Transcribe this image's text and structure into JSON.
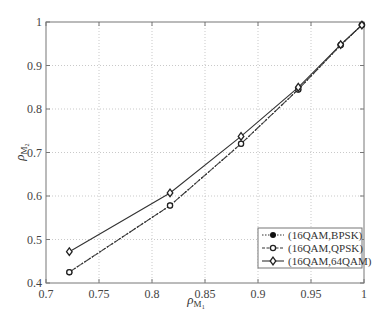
{
  "chart_data": {
    "type": "line",
    "title": "",
    "xlabel": "ρ_M1",
    "ylabel": "ρ_M2",
    "xlabel_main": "ρ",
    "xlabel_sub": "M",
    "xlabel_subsub": "1",
    "ylabel_main": "ρ",
    "ylabel_sub": "M",
    "ylabel_subsub": "2",
    "xlim": [
      0.7,
      1.0
    ],
    "ylim": [
      0.4,
      1.0
    ],
    "xticks": [
      "0.7",
      "0.75",
      "0.8",
      "0.85",
      "0.9",
      "0.95",
      "1"
    ],
    "yticks": [
      "0.4",
      "0.5",
      "0.6",
      "0.7",
      "0.8",
      "0.9",
      "1"
    ],
    "grid": true,
    "legend_position": "lower right",
    "x": [
      0.722,
      0.817,
      0.884,
      0.938,
      0.978,
      0.998
    ],
    "series": [
      {
        "name": "(16QAM,BPSK)",
        "style": "dotted",
        "marker": "filled-circle",
        "values": [
          0.425,
          0.578,
          0.72,
          0.845,
          0.947,
          0.993
        ]
      },
      {
        "name": "(16QAM,QPSK)",
        "style": "dashed",
        "marker": "open-circle",
        "values": [
          0.425,
          0.578,
          0.72,
          0.845,
          0.947,
          0.993
        ]
      },
      {
        "name": "(16QAM,64QAM)",
        "style": "solid",
        "marker": "diamond",
        "values": [
          0.472,
          0.607,
          0.737,
          0.85,
          0.948,
          0.993
        ]
      }
    ]
  }
}
